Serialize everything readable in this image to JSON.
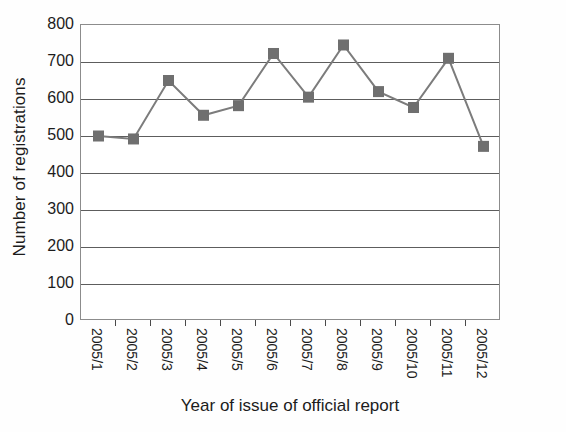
{
  "chart_data": {
    "type": "line",
    "title": "",
    "subtitle": "",
    "xlabel": "Year of issue of official report",
    "ylabel": "Number of registrations",
    "categories": [
      "2005/1",
      "2005/2",
      "2005/3",
      "2005/4",
      "2005/5",
      "2005/6",
      "2005/7",
      "2005/8",
      "2005/9",
      "2005/10",
      "2005/11",
      "2005/12"
    ],
    "values": [
      500,
      492,
      650,
      556,
      582,
      723,
      605,
      746,
      620,
      577,
      710,
      472
    ],
    "series": [
      {
        "name": "Number of registrations",
        "values": [
          500,
          492,
          650,
          556,
          582,
          723,
          605,
          746,
          620,
          577,
          710,
          472
        ]
      }
    ],
    "ylim": [
      0,
      800
    ],
    "ytick_step": 100,
    "yticks": [
      "800",
      "700",
      "600",
      "500",
      "400",
      "300",
      "200",
      "100",
      "0"
    ],
    "ytick_values": [
      800,
      700,
      600,
      500,
      400,
      300,
      200,
      100,
      0
    ],
    "grid": "horizontal",
    "legend": "none",
    "marker": "square",
    "colors": {
      "line": "#7c7c7c",
      "marker": "#6f6f6f",
      "gridline": "#5d5d5d",
      "frame": "#8c8c8c",
      "text": "#1c1c1c",
      "background": "#ffffff"
    }
  }
}
